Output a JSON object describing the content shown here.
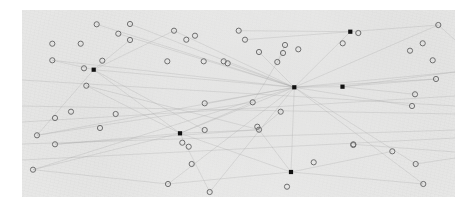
{
  "figure": {
    "kind": "node-link-scatter-plot",
    "background_color": "#ffffff",
    "panel_color": "#ededec",
    "panel_rect": {
      "x": 22,
      "y": 10,
      "width": 433,
      "height": 187
    },
    "texture": "faint mottled scanned-paper grain across panel",
    "axes_visible": false,
    "gridlines": false,
    "title": "",
    "xlabel": "",
    "ylabel": "",
    "legend": null,
    "tick_labels": []
  },
  "chart_data": {
    "type": "scatter",
    "title": "",
    "xlabel": "",
    "ylabel": "",
    "xlim": [
      0,
      433
    ],
    "ylim": [
      0,
      187
    ],
    "grid": false,
    "legend": null,
    "coordinate_space": "pixels relative to panel top-left (22,10); y increases downward",
    "series": [
      {
        "name": "hollow-circle-nodes",
        "marker": "open-circle",
        "marker_radius": 2.6,
        "stroke": "#6f6f6f",
        "fill": "none",
        "count": 58,
        "points": [
          [
            108,
            14
          ],
          [
            74.7,
            14.3
          ],
          [
            96.3,
            23.7
          ],
          [
            152,
            20.7
          ],
          [
            108,
            30
          ],
          [
            173,
            25.7
          ],
          [
            216.7,
            20.7
          ],
          [
            164.3,
            29.7
          ],
          [
            58.7,
            33.7
          ],
          [
            30.3,
            33.7
          ],
          [
            223,
            29.7
          ],
          [
            263,
            35
          ],
          [
            276.3,
            39.3
          ],
          [
            145.3,
            51.3
          ],
          [
            201.7,
            51.3
          ],
          [
            336.3,
            23
          ],
          [
            416.3,
            15
          ],
          [
            400.7,
            33.3
          ],
          [
            181.7,
            51.3
          ],
          [
            30.3,
            50.3
          ],
          [
            62,
            58.3
          ],
          [
            80.3,
            50.7
          ],
          [
            255.3,
            52
          ],
          [
            261,
            43
          ],
          [
            388,
            40.7
          ],
          [
            410.7,
            50.3
          ],
          [
            205.7,
            53.3
          ],
          [
            414,
            69
          ],
          [
            393,
            84.3
          ],
          [
            237,
            42
          ],
          [
            320.7,
            33.3
          ],
          [
            93.7,
            104
          ],
          [
            64.3,
            75.7
          ],
          [
            33,
            108
          ],
          [
            15,
            125.3
          ],
          [
            230.7,
            92.3
          ],
          [
            49,
            101.7
          ],
          [
            182.7,
            93.3
          ],
          [
            258.7,
            101.7
          ],
          [
            235.3,
            116.7
          ],
          [
            237,
            119.7
          ],
          [
            33,
            134.3
          ],
          [
            78,
            118
          ],
          [
            331.3,
            134.3
          ],
          [
            182.7,
            120
          ],
          [
            160.3,
            132.7
          ],
          [
            166.7,
            136.7
          ],
          [
            169.7,
            154
          ],
          [
            291.7,
            152.3
          ],
          [
            331.3,
            135
          ],
          [
            370.3,
            141.3
          ],
          [
            146,
            174
          ],
          [
            187.7,
            182
          ],
          [
            265,
            176.7
          ],
          [
            390,
            96
          ],
          [
            393.7,
            154
          ],
          [
            401.3,
            174
          ],
          [
            11,
            159.7
          ]
        ]
      },
      {
        "name": "filled-square-hubs",
        "marker": "filled-square",
        "marker_size": 4.2,
        "fill": "#111111",
        "count": 6,
        "points": [
          [
            71.7,
            59.7
          ],
          [
            272.3,
            77.3
          ],
          [
            320.5,
            76.7
          ],
          [
            328.3,
            21.7
          ],
          [
            158,
            123.3
          ],
          [
            269,
            162
          ]
        ]
      }
    ],
    "edges": {
      "name": "connection-lines",
      "stroke": "#9a9a9a",
      "stroke_width": 0.45,
      "opacity": 0.55,
      "count": 62,
      "description": "faint thin straight line segments linking nodes, densest around the central hub",
      "segments": [
        [
          272.3,
          77.3,
          71.7,
          59.7
        ],
        [
          272.3,
          77.3,
          328.3,
          21.7
        ],
        [
          272.3,
          77.3,
          320.5,
          76.7
        ],
        [
          272.3,
          77.3,
          158,
          123.3
        ],
        [
          272.3,
          77.3,
          269,
          162
        ],
        [
          272.3,
          77.3,
          416.3,
          15
        ],
        [
          272.3,
          77.3,
          433,
          62
        ],
        [
          272.3,
          77.3,
          108,
          14
        ],
        [
          272.3,
          77.3,
          152,
          20.7
        ],
        [
          272.3,
          77.3,
          30.3,
          50.3
        ],
        [
          272.3,
          77.3,
          15,
          125.3
        ],
        [
          272.3,
          77.3,
          11,
          159.7
        ],
        [
          272.3,
          77.3,
          146,
          174
        ],
        [
          272.3,
          77.3,
          187.7,
          182
        ],
        [
          272.3,
          77.3,
          393.7,
          154
        ],
        [
          272.3,
          77.3,
          401.3,
          174
        ],
        [
          272.3,
          77.3,
          390,
          96
        ],
        [
          272.3,
          77.3,
          414,
          69
        ],
        [
          272.3,
          77.3,
          205.7,
          53.3
        ],
        [
          272.3,
          77.3,
          237,
          42
        ],
        [
          71.7,
          59.7,
          30.3,
          50.3
        ],
        [
          71.7,
          59.7,
          108,
          30
        ],
        [
          71.7,
          59.7,
          152,
          20.7
        ],
        [
          71.7,
          59.7,
          15,
          125.3
        ],
        [
          71.7,
          59.7,
          158,
          123.3
        ],
        [
          71.7,
          59.7,
          182.7,
          120
        ],
        [
          158,
          123.3,
          33,
          134.3
        ],
        [
          158,
          123.3,
          11,
          159.7
        ],
        [
          158,
          123.3,
          237,
          119.7
        ],
        [
          158,
          123.3,
          230.7,
          92.3
        ],
        [
          158,
          123.3,
          269,
          162
        ],
        [
          158,
          123.3,
          187.7,
          182
        ],
        [
          158,
          123.3,
          64.3,
          75.7
        ],
        [
          269,
          162,
          401.3,
          174
        ],
        [
          269,
          162,
          370.3,
          141.3
        ],
        [
          269,
          162,
          146,
          174
        ],
        [
          269,
          162,
          237,
          119.7
        ],
        [
          328.3,
          21.7,
          416.3,
          15
        ],
        [
          328.3,
          21.7,
          216.7,
          20.7
        ],
        [
          328.3,
          21.7,
          223,
          29.7
        ],
        [
          320.5,
          76.7,
          433,
          62
        ],
        [
          320.5,
          76.7,
          414,
          69
        ],
        [
          320.5,
          76.7,
          393,
          84.3
        ],
        [
          15,
          125.3,
          230.7,
          92.3
        ],
        [
          11,
          159.7,
          146,
          174
        ],
        [
          33,
          134.3,
          237,
          119.7
        ],
        [
          0,
          112,
          433,
          86
        ],
        [
          0,
          134,
          433,
          120
        ],
        [
          0,
          150,
          433,
          128
        ],
        [
          0,
          96,
          433,
          104
        ],
        [
          0,
          70,
          433,
          96
        ],
        [
          64.3,
          75.7,
          237,
          119.7
        ],
        [
          237,
          119.7,
          235.3,
          116.7
        ],
        [
          237,
          119.7,
          258.7,
          101.7
        ],
        [
          230.7,
          92.3,
          261,
          43
        ],
        [
          255.3,
          52,
          263,
          35
        ],
        [
          182.7,
          93.3,
          272.3,
          77.3
        ],
        [
          96.3,
          23.7,
          272.3,
          77.3
        ],
        [
          74.7,
          14.3,
          272.3,
          77.3
        ],
        [
          416.3,
          15,
          433,
          30
        ],
        [
          393.7,
          154,
          433,
          148
        ],
        [
          331.3,
          134.3,
          433,
          142
        ]
      ]
    }
  }
}
